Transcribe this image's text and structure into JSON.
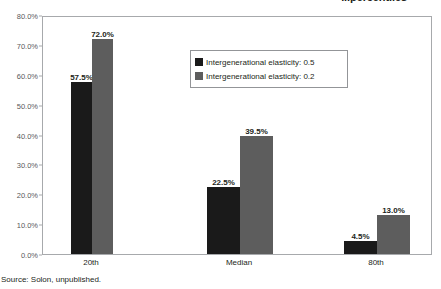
{
  "chart_data": {
    "type": "bar",
    "title": "...percentiles",
    "xlabel": "",
    "ylabel": "",
    "ylim": [
      0,
      80
    ],
    "grid": false,
    "legend_position": "inside-top-center",
    "categories": [
      "20th",
      "Median",
      "80th"
    ],
    "series": [
      {
        "name": "Intergenerational elasticity: 0.5",
        "color": "#1a1a1a",
        "values": [
          57.5,
          22.5,
          4.5
        ],
        "labels": [
          "57.5%",
          "22.5%",
          "4.5%"
        ]
      },
      {
        "name": "Intergenerational elasticity: 0.2",
        "color": "#5d5d5d",
        "values": [
          72.0,
          39.5,
          13.0
        ],
        "labels": [
          "72.0%",
          "39.5%",
          "13.0%"
        ]
      }
    ],
    "yticks": [
      0,
      10,
      20,
      30,
      40,
      50,
      60,
      70,
      80
    ],
    "ytick_labels": [
      "0.0%",
      "10.0%",
      "20.0%",
      "30.0%",
      "40.0%",
      "50.0%",
      "60.0%",
      "70.0%",
      "80.0%"
    ]
  },
  "source": {
    "text": "Source: Solon, unpublished."
  }
}
